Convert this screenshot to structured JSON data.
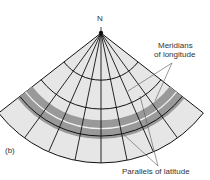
{
  "figure": {
    "north_label": "N",
    "panel_label": "(b)",
    "meridians_label_line1": "Meridians",
    "meridians_label_line2": "of longitude",
    "parallels_label": "Parallels of latitude"
  },
  "colors": {
    "fill": "#e6e6e6",
    "band": "#999999",
    "line": "#111111"
  }
}
